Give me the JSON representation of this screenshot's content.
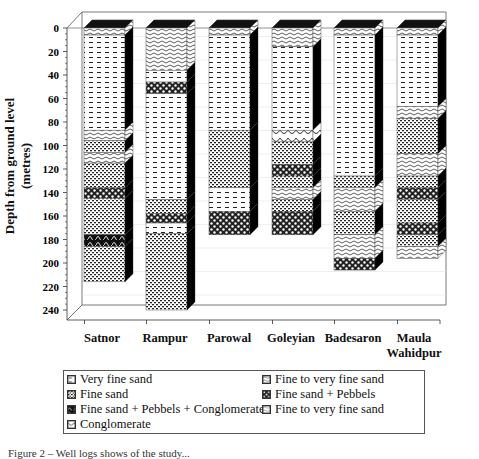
{
  "chart_data": {
    "type": "bar",
    "subtype": "stacked 3D lithology columns (well logs)",
    "title": "",
    "ylabel": "Depth from ground level (metres)",
    "xlabel": "",
    "ylim": [
      0,
      240
    ],
    "y_inverted": true,
    "yticks": [
      0,
      20,
      40,
      60,
      80,
      100,
      120,
      140,
      160,
      180,
      200,
      220,
      240
    ],
    "grid": true,
    "legend_position": "bottom",
    "categories": [
      "Satnor",
      "Rampur",
      "Parowal",
      "Goleyian",
      "Badesaron",
      "Maula Wahidpur"
    ],
    "category_labels": [
      [
        "Satnor"
      ],
      [
        "Rampur"
      ],
      [
        "Parowal"
      ],
      [
        "Goleyian"
      ],
      [
        "Badesaron"
      ],
      [
        "Maula",
        "Wahidpur"
      ]
    ],
    "legend": [
      {
        "key": "vfs",
        "label": "Very fine sand"
      },
      {
        "key": "fs",
        "label": "Fine sand"
      },
      {
        "key": "fspc",
        "label": "Fine sand + Pebbels + Conglomerate"
      },
      {
        "key": "cg",
        "label": "Conglomerate"
      },
      {
        "key": "ftv",
        "label": "Fine to very fine sand"
      },
      {
        "key": "fsp",
        "label": "Fine sand + Pebbels"
      },
      {
        "key": "ftv2",
        "label": "Fine to very fine sand"
      }
    ],
    "columns": [
      {
        "name": "Satnor",
        "total_depth": 216,
        "layers": [
          {
            "top": 0,
            "bottom": 6,
            "type": "ftv"
          },
          {
            "top": 6,
            "bottom": 87,
            "type": "vfs"
          },
          {
            "top": 87,
            "bottom": 96,
            "type": "ftv"
          },
          {
            "top": 96,
            "bottom": 106,
            "type": "fs"
          },
          {
            "top": 106,
            "bottom": 115,
            "type": "ftv"
          },
          {
            "top": 115,
            "bottom": 136,
            "type": "fs"
          },
          {
            "top": 136,
            "bottom": 145,
            "type": "fsp"
          },
          {
            "top": 145,
            "bottom": 176,
            "type": "fs"
          },
          {
            "top": 176,
            "bottom": 186,
            "type": "fspc"
          },
          {
            "top": 186,
            "bottom": 216,
            "type": "fs"
          }
        ]
      },
      {
        "name": "Rampur",
        "total_depth": 240,
        "layers": [
          {
            "top": 0,
            "bottom": 36,
            "type": "ftv"
          },
          {
            "top": 36,
            "bottom": 46,
            "type": "vfs"
          },
          {
            "top": 46,
            "bottom": 56,
            "type": "fsp"
          },
          {
            "top": 56,
            "bottom": 146,
            "type": "vfs"
          },
          {
            "top": 146,
            "bottom": 158,
            "type": "fs"
          },
          {
            "top": 158,
            "bottom": 166,
            "type": "fsp"
          },
          {
            "top": 166,
            "bottom": 175,
            "type": "vfs"
          },
          {
            "top": 175,
            "bottom": 240,
            "type": "fs"
          }
        ]
      },
      {
        "name": "Parowal",
        "total_depth": 176,
        "layers": [
          {
            "top": 0,
            "bottom": 6,
            "type": "ftv"
          },
          {
            "top": 6,
            "bottom": 87,
            "type": "vfs"
          },
          {
            "top": 87,
            "bottom": 136,
            "type": "fs"
          },
          {
            "top": 136,
            "bottom": 156,
            "type": "vfs"
          },
          {
            "top": 156,
            "bottom": 176,
            "type": "fsp"
          }
        ]
      },
      {
        "name": "Goleyian",
        "total_depth": 176,
        "layers": [
          {
            "top": 0,
            "bottom": 16,
            "type": "ftv"
          },
          {
            "top": 16,
            "bottom": 87,
            "type": "vfs"
          },
          {
            "top": 87,
            "bottom": 97,
            "type": "cg"
          },
          {
            "top": 97,
            "bottom": 116,
            "type": "fs"
          },
          {
            "top": 116,
            "bottom": 126,
            "type": "fsp"
          },
          {
            "top": 126,
            "bottom": 136,
            "type": "fs"
          },
          {
            "top": 136,
            "bottom": 146,
            "type": "ftv"
          },
          {
            "top": 146,
            "bottom": 156,
            "type": "fs"
          },
          {
            "top": 156,
            "bottom": 176,
            "type": "fsp"
          }
        ]
      },
      {
        "name": "Badesaron",
        "total_depth": 206,
        "layers": [
          {
            "top": 0,
            "bottom": 6,
            "type": "ftv"
          },
          {
            "top": 6,
            "bottom": 126,
            "type": "vfs"
          },
          {
            "top": 126,
            "bottom": 136,
            "type": "fs"
          },
          {
            "top": 136,
            "bottom": 156,
            "type": "ftv"
          },
          {
            "top": 156,
            "bottom": 176,
            "type": "fs"
          },
          {
            "top": 176,
            "bottom": 196,
            "type": "ftv"
          },
          {
            "top": 196,
            "bottom": 206,
            "type": "fsp"
          }
        ]
      },
      {
        "name": "Maula Wahidpur",
        "total_depth": 196,
        "layers": [
          {
            "top": 0,
            "bottom": 6,
            "type": "ftv"
          },
          {
            "top": 6,
            "bottom": 67,
            "type": "vfs"
          },
          {
            "top": 67,
            "bottom": 77,
            "type": "ftv"
          },
          {
            "top": 77,
            "bottom": 107,
            "type": "fs"
          },
          {
            "top": 107,
            "bottom": 126,
            "type": "ftv"
          },
          {
            "top": 126,
            "bottom": 136,
            "type": "fs"
          },
          {
            "top": 136,
            "bottom": 146,
            "type": "fsp"
          },
          {
            "top": 146,
            "bottom": 166,
            "type": "fs"
          },
          {
            "top": 166,
            "bottom": 176,
            "type": "fsp"
          },
          {
            "top": 176,
            "bottom": 186,
            "type": "fs"
          },
          {
            "top": 186,
            "bottom": 196,
            "type": "ftv"
          }
        ]
      }
    ]
  },
  "caption": "Figure 2 – Well logs shows of the study..."
}
